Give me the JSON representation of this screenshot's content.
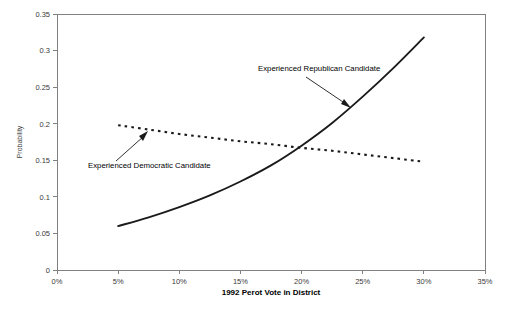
{
  "chart_data": {
    "type": "line",
    "title": "",
    "xlabel": "1992 Perot Vote in District",
    "ylabel": "Probability",
    "xlim": [
      0,
      35
    ],
    "ylim": [
      0,
      0.35
    ],
    "grid": false,
    "legend_position": "none",
    "x_tick_labels": [
      "0%",
      "5%",
      "10%",
      "15%",
      "20%",
      "25%",
      "30%",
      "35%"
    ],
    "x_tick_values": [
      0,
      5,
      10,
      15,
      20,
      25,
      30,
      35
    ],
    "y_tick_labels": [
      "0",
      "0.05",
      "0.1",
      "0.15",
      "0.2",
      "0.25",
      "0.3",
      "0.35"
    ],
    "y_tick_values": [
      0,
      0.05,
      0.1,
      0.15,
      0.2,
      0.25,
      0.3,
      0.35
    ],
    "x": [
      5,
      7.5,
      10,
      12.5,
      15,
      17.5,
      20,
      22.5,
      25,
      27.5,
      30
    ],
    "series": [
      {
        "name": "Experienced Republican Candidate",
        "style": "solid",
        "values": [
          0.06,
          0.072,
          0.086,
          0.102,
          0.121,
          0.143,
          0.17,
          0.201,
          0.237,
          0.276,
          0.318
        ]
      },
      {
        "name": "Experienced Democratic Candidate",
        "style": "dotted",
        "values": [
          0.198,
          0.192,
          0.186,
          0.181,
          0.176,
          0.172,
          0.167,
          0.163,
          0.158,
          0.153,
          0.148
        ]
      }
    ],
    "annotations": [
      {
        "text": "Experienced Republican Candidate",
        "target_x": 23.4,
        "target_y": 0.222
      },
      {
        "text": "Experienced Democratic Candidate",
        "target_x": 8.2,
        "target_y": 0.19
      }
    ],
    "colors": {
      "series_line": "#1a1a1a",
      "axis": "#808080",
      "tick_text": "#3a3a3a",
      "background": "#ffffff"
    }
  }
}
